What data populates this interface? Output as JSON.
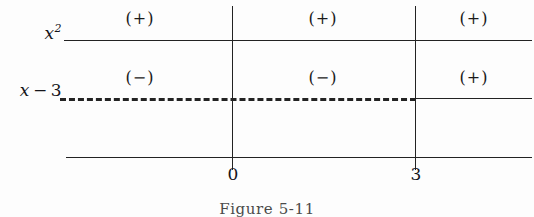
{
  "figure": {
    "caption": "Figure 5-11",
    "type": "sign-chart",
    "line_color": "#232323",
    "text_color": "#15151a"
  },
  "rows": [
    {
      "id": "xsq",
      "label_base": "x",
      "label_sup": "2",
      "label_op": "",
      "label_num": "",
      "line_style": "solid"
    },
    {
      "id": "xminus3",
      "label_base": "x",
      "label_sup": "",
      "label_op": "−",
      "label_num": "3",
      "line_style": "dashed-then-solid"
    }
  ],
  "critical_points": [
    {
      "id": "zero",
      "value": "0",
      "x_px": 232
    },
    {
      "id": "three",
      "value": "3",
      "x_px": 415
    }
  ],
  "signs": {
    "xsq": {
      "left": "(+)",
      "middle": "(+)",
      "right": "(+)"
    },
    "xminus3": {
      "left": "(−)",
      "middle": "(−)",
      "right": "(+)"
    }
  },
  "chart_data": {
    "type": "table",
    "title": "Figure 5-11",
    "xlabel": "",
    "ylabel": "",
    "categories": [
      "x < 0",
      "0 < x < 3",
      "x > 3"
    ],
    "tick_labels": [
      "0",
      "3"
    ],
    "series": [
      {
        "name": "x²",
        "values": [
          "(+)",
          "(+)",
          "(+)"
        ]
      },
      {
        "name": "x − 3",
        "values": [
          "(−)",
          "(−)",
          "(+)"
        ]
      }
    ],
    "grid": false,
    "legend": "none"
  }
}
